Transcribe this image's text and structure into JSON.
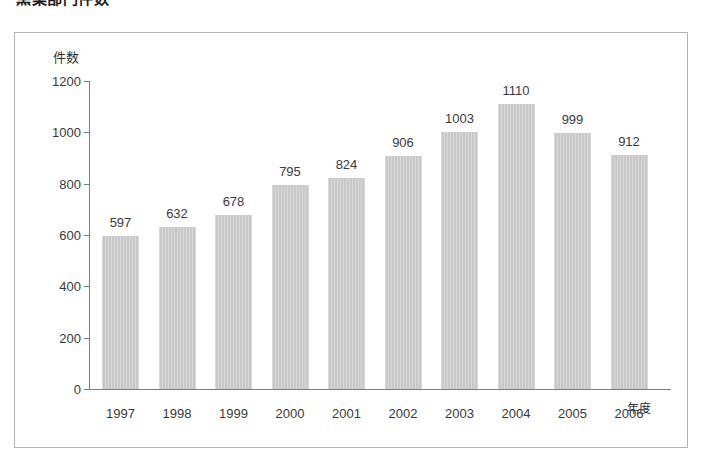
{
  "figure": {
    "title": "窯業部門件数"
  },
  "chart_data": {
    "type": "bar",
    "title": "窯業部門件数",
    "xlabel": "年度",
    "ylabel": "件数",
    "categories": [
      "1997",
      "1998",
      "1999",
      "2000",
      "2001",
      "2002",
      "2003",
      "2004",
      "2005",
      "2006"
    ],
    "values": [
      597,
      632,
      678,
      795,
      824,
      906,
      1003,
      1110,
      999,
      912
    ],
    "ylim": [
      0,
      1200
    ],
    "yticks": [
      0,
      200,
      400,
      600,
      800,
      1000,
      1200
    ],
    "ytick_labels": [
      "0",
      "200",
      "400",
      "600",
      "800",
      "1000",
      "1200"
    ],
    "data_labels": [
      "597",
      "632",
      "678",
      "795",
      "824",
      "906",
      "1003",
      "1110",
      "999",
      "912"
    ],
    "grid": false,
    "legend": null,
    "bar_color": "#c8c8c8",
    "axis_color": "#7d7d7d",
    "frame_color": "#b4b4b4",
    "text_color": "#3a3a3a"
  }
}
